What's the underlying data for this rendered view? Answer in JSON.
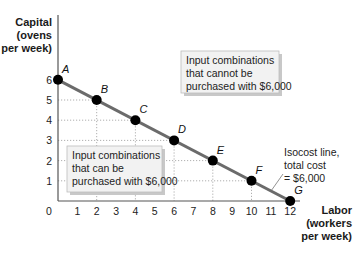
{
  "chart_data": {
    "type": "line",
    "title": "",
    "xlabel": [
      "Labor",
      "(workers",
      "per week)"
    ],
    "ylabel": [
      "Capital",
      "(ovens",
      "per week)"
    ],
    "xlim": [
      0,
      12
    ],
    "ylim": [
      0,
      6
    ],
    "x_ticks": [
      0,
      1,
      2,
      3,
      4,
      5,
      6,
      7,
      8,
      9,
      10,
      11,
      12
    ],
    "y_ticks": [
      1,
      2,
      3,
      4,
      5,
      6
    ],
    "grid": false,
    "series": [
      {
        "name": "Isocost line, total cost = $6,000",
        "points": [
          {
            "label": "A",
            "x": 0,
            "y": 6
          },
          {
            "label": "B",
            "x": 2,
            "y": 5
          },
          {
            "label": "C",
            "x": 4,
            "y": 4
          },
          {
            "label": "D",
            "x": 6,
            "y": 3
          },
          {
            "label": "E",
            "x": 8,
            "y": 2
          },
          {
            "label": "F",
            "x": 10,
            "y": 1
          },
          {
            "label": "G",
            "x": 12,
            "y": 0
          }
        ]
      }
    ],
    "annotations": [
      {
        "id": "cannot",
        "lines": [
          "Input combinations",
          "that cannot be",
          "purchased with $6,000"
        ]
      },
      {
        "id": "can",
        "lines": [
          "Input combinations",
          "that can be",
          "purchased with $6,000"
        ]
      },
      {
        "id": "isocost",
        "lines": [
          "Isocost line,",
          "total cost",
          "= $6,000"
        ]
      }
    ],
    "colors": {
      "line": "#6b6b6b",
      "point": "#000000",
      "axis": "#555555",
      "guide": "#9a9a9a",
      "box_fill": "#f2f2f2",
      "box_border": "#bdbdbd",
      "box_shadow": "#c8c8c8"
    }
  }
}
